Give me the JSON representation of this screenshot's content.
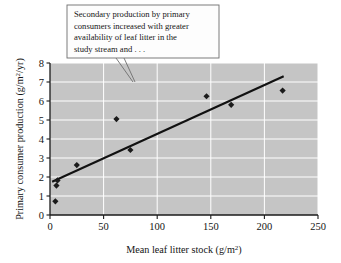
{
  "figure": {
    "background_color": "#ffffff",
    "plot_background_color": "#c5c5c5",
    "gridline_color": "#ffffff",
    "marker_color": "#1b1b1b",
    "line_color": "#111111"
  },
  "callout": {
    "lines": [
      "Secondary production by primary",
      "consumers increased with greater",
      "availability of leaf litter in the",
      "study stream and . . ."
    ],
    "border_color": "#6e6e6e",
    "fill_color": "#fdfdfd"
  },
  "chart_data": {
    "type": "scatter",
    "title": "",
    "xlabel": "Mean leaf litter stock (g/m",
    "xlabel_sup": "2",
    "xlabel_tail": ")",
    "ylabel": "Primary consumer production (g/m",
    "ylabel_sup": "2",
    "ylabel_tail": "/yr)",
    "xlim": [
      0,
      250
    ],
    "ylim": [
      0,
      8
    ],
    "xticks": [
      0,
      50,
      100,
      150,
      200,
      250
    ],
    "yticks": [
      0,
      1,
      2,
      3,
      4,
      5,
      6,
      7,
      8
    ],
    "xtick_labels": [
      "0",
      "50",
      "100",
      "150",
      "200",
      "250"
    ],
    "ytick_labels": [
      "0",
      "1",
      "2",
      "3",
      "4",
      "5",
      "6",
      "7",
      "8"
    ],
    "grid": true,
    "legend": "none",
    "points": [
      {
        "x": 5,
        "y": 0.72
      },
      {
        "x": 6,
        "y": 1.55
      },
      {
        "x": 7,
        "y": 1.82
      },
      {
        "x": 25,
        "y": 2.63
      },
      {
        "x": 62,
        "y": 5.05
      },
      {
        "x": 75,
        "y": 3.42
      },
      {
        "x": 146,
        "y": 6.25
      },
      {
        "x": 169,
        "y": 5.8
      },
      {
        "x": 217,
        "y": 6.55
      }
    ],
    "trend_line": {
      "x0": 2,
      "y0": 1.75,
      "x1": 218,
      "y1": 7.3
    }
  }
}
